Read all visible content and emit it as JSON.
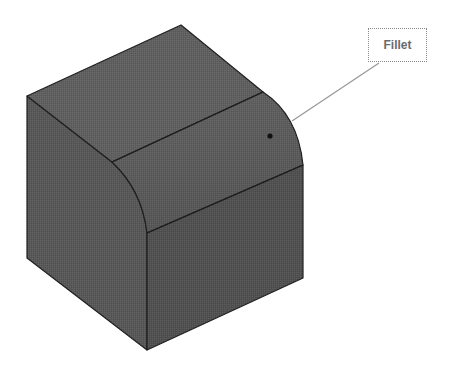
{
  "figure": {
    "callout": {
      "label": "Fillet",
      "pointer_target": "rounded-edge-face"
    },
    "colors": {
      "background": "#ffffff",
      "top_face": "#5e5e5e",
      "left_face": "#555555",
      "fillet_face": "#5a5a5a",
      "front_face": "#4f4f4f",
      "edge": "#1f1f1f",
      "leader_line": "#9a9a9a",
      "label_text": "#6a6a6a"
    }
  }
}
